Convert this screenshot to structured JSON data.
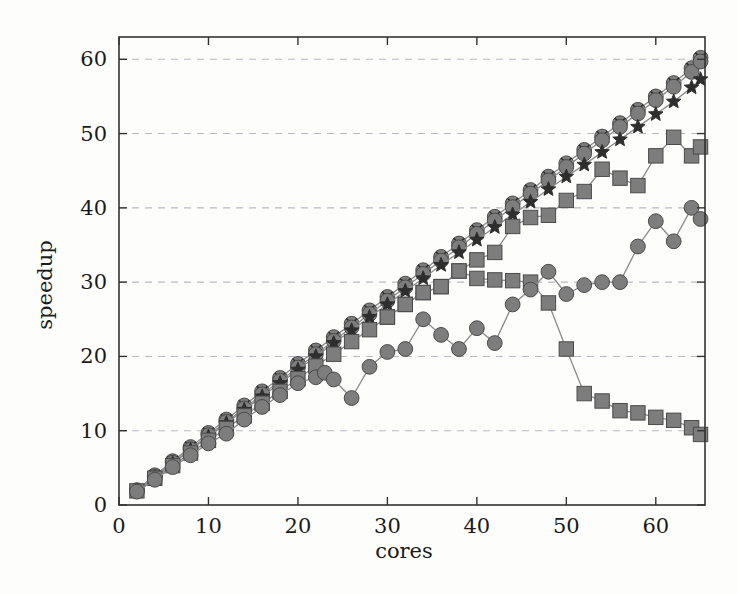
{
  "chart_data": {
    "type": "line",
    "title": "",
    "xlabel": "cores",
    "ylabel": "speedup",
    "xlim": [
      0,
      65.5
    ],
    "ylim": [
      0,
      63
    ],
    "xticks": [
      0,
      10,
      20,
      30,
      40,
      50,
      60
    ],
    "yticks": [
      0,
      10,
      20,
      30,
      40,
      50,
      60
    ],
    "xtick_labels": [
      "0",
      "10",
      "20",
      "30",
      "40",
      "50",
      "60"
    ],
    "ytick_labels": [
      "0",
      "10",
      "20",
      "30",
      "40",
      "50",
      "60"
    ],
    "grid": "horizontal-dashed",
    "legend": "none",
    "marker_color": "#7d7d7d",
    "marker_edge_color": "#4a4a4a",
    "line_color": "#8a8a8a",
    "axis_color": "#33332f",
    "grid_color": "#b9b9c4",
    "series": [
      {
        "name": "ideal-linear-circle-x",
        "marker": "circle-x",
        "x": [
          2,
          4,
          6,
          8,
          10,
          12,
          14,
          16,
          18,
          20,
          22,
          24,
          26,
          28,
          30,
          32,
          34,
          36,
          38,
          40,
          42,
          44,
          46,
          48,
          50,
          52,
          54,
          56,
          58,
          60,
          62,
          64,
          65
        ],
        "values": [
          2.0,
          4.0,
          5.9,
          7.8,
          9.7,
          11.5,
          13.4,
          15.3,
          17.1,
          19.0,
          20.8,
          22.6,
          24.4,
          26.2,
          28.0,
          29.8,
          31.6,
          33.4,
          35.2,
          37.0,
          38.8,
          40.6,
          42.4,
          44.2,
          46.0,
          47.8,
          49.6,
          51.4,
          53.2,
          55.0,
          56.8,
          58.8,
          60.2
        ]
      },
      {
        "name": "near-linear-circle",
        "marker": "circle",
        "x": [
          2,
          4,
          6,
          8,
          10,
          12,
          14,
          16,
          18,
          20,
          22,
          24,
          26,
          28,
          30,
          32,
          34,
          36,
          38,
          40,
          42,
          44,
          46,
          48,
          50,
          52,
          54,
          56,
          58,
          60,
          62,
          64,
          65
        ],
        "values": [
          1.9,
          3.8,
          5.7,
          7.5,
          9.4,
          11.2,
          13.0,
          14.9,
          16.7,
          18.5,
          20.3,
          22.1,
          23.9,
          25.7,
          27.5,
          29.3,
          31.1,
          32.9,
          34.7,
          36.5,
          38.3,
          40.1,
          41.9,
          43.7,
          45.5,
          47.3,
          49.1,
          50.9,
          52.7,
          54.5,
          56.3,
          58.3,
          59.7
        ]
      },
      {
        "name": "star-series",
        "marker": "star",
        "x": [
          2,
          4,
          6,
          8,
          10,
          12,
          14,
          16,
          18,
          20,
          22,
          24,
          26,
          28,
          30,
          32,
          34,
          36,
          38,
          40,
          42,
          44,
          46,
          48,
          50,
          52,
          54,
          56,
          58,
          60,
          62,
          64,
          65
        ],
        "values": [
          1.9,
          3.7,
          5.6,
          7.4,
          9.2,
          11.0,
          12.8,
          14.6,
          16.4,
          18.2,
          20.0,
          21.8,
          23.5,
          25.3,
          27.0,
          28.8,
          30.5,
          32.3,
          34.0,
          35.7,
          37.4,
          39.1,
          40.8,
          42.5,
          44.2,
          45.8,
          47.5,
          49.2,
          50.9,
          52.6,
          54.3,
          56.2,
          57.3
        ]
      },
      {
        "name": "rising-square-series",
        "marker": "square",
        "x": [
          2,
          4,
          6,
          8,
          10,
          12,
          14,
          16,
          18,
          20,
          22,
          24,
          26,
          28,
          30,
          32,
          34,
          36,
          38,
          40,
          42,
          44,
          46,
          48,
          50,
          52,
          54,
          56,
          58,
          60,
          62,
          64,
          65
        ],
        "values": [
          1.9,
          3.6,
          5.3,
          7.0,
          8.7,
          10.3,
          12.0,
          13.7,
          15.3,
          17.0,
          18.7,
          20.3,
          22.0,
          23.6,
          25.3,
          27.0,
          28.6,
          29.4,
          31.5,
          33.0,
          34.0,
          37.5,
          38.7,
          39.0,
          41.0,
          42.2,
          45.2,
          44.0,
          43.0,
          47.0,
          49.5,
          47.0,
          48.2
        ]
      },
      {
        "name": "collapsing-square-series",
        "marker": "square",
        "x": [
          30,
          32,
          34,
          36,
          38,
          40,
          42,
          44,
          46,
          48,
          50,
          52,
          54,
          56,
          58,
          60,
          62,
          64,
          65
        ],
        "values": [
          25.3,
          27.0,
          28.6,
          29.4,
          31.5,
          30.5,
          30.3,
          30.2,
          30.0,
          27.2,
          21.0,
          15.0,
          14.0,
          12.7,
          12.4,
          11.8,
          11.4,
          10.4,
          9.5
        ]
      },
      {
        "name": "erratic-circle-series",
        "marker": "circle",
        "x": [
          2,
          4,
          6,
          8,
          10,
          12,
          14,
          16,
          18,
          20,
          22,
          23,
          24,
          26,
          28,
          30,
          32,
          34,
          36,
          38,
          40,
          42,
          44,
          46,
          48,
          50,
          52,
          54,
          56,
          58,
          60,
          62,
          64,
          65
        ],
        "values": [
          1.8,
          3.4,
          5.1,
          6.7,
          8.3,
          9.6,
          11.5,
          13.2,
          14.8,
          16.4,
          17.2,
          17.8,
          16.9,
          14.4,
          18.6,
          20.6,
          21.0,
          25.0,
          22.9,
          21.0,
          23.8,
          21.8,
          27.0,
          29.0,
          31.4,
          28.4,
          29.6,
          30.0,
          30.0,
          34.8,
          38.2,
          35.5,
          40.0,
          38.5
        ]
      }
    ]
  }
}
